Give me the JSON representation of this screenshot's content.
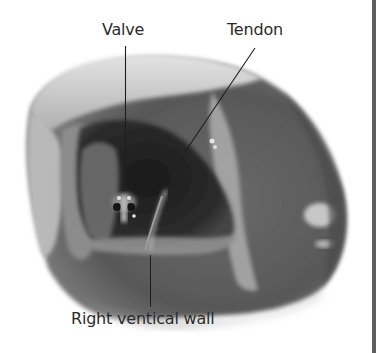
{
  "figure": {
    "style": "grayscale photograph",
    "labels": [
      {
        "id": "valve",
        "text": "Valve"
      },
      {
        "id": "tendon",
        "text": "Tendon"
      },
      {
        "id": "right-wall",
        "text": "Right ventical wall"
      }
    ]
  },
  "colors": {
    "background": "#ffffff",
    "label_text": "#2b2b2b",
    "leader_line": "#1e1e1e",
    "frame_border": "#5e5e5e"
  }
}
